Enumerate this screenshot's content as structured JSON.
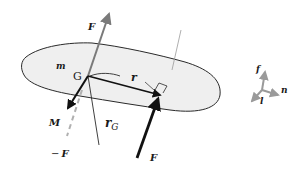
{
  "diagram": {
    "colors": {
      "body_fill": "#efefef",
      "body_outline": "#2a2a2a",
      "force_gray": "#7a7a7a",
      "force_black": "#111111",
      "dashed_gray": "#b0b0b0",
      "axes_gray": "#9a9a9a"
    },
    "labels": {
      "force_top": "F",
      "mass": "m",
      "center": "G",
      "position": "r",
      "moment": "M",
      "rG_main": "r",
      "rG_sub": "G",
      "neg_force_sign": "−",
      "neg_force": "F",
      "force_bottom": "F",
      "axis_f": "f",
      "axis_n": "n",
      "axis_l": "l"
    }
  }
}
